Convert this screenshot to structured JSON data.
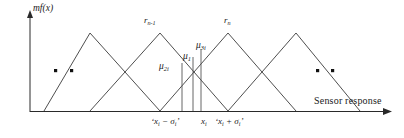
{
  "figure": {
    "axes": {
      "y_label": "mf(x)",
      "x_label": "Sensor response"
    },
    "fuzzy_sets": [
      {
        "name": "r-n-minus-1",
        "label_main": "r",
        "label_sub": "n-1"
      },
      {
        "name": "r-n",
        "label_main": "r",
        "label_sub": "n"
      }
    ],
    "membership_values": [
      {
        "name": "mu-2i",
        "label_main": "μ",
        "label_sub": "2i"
      },
      {
        "name": "mu-1i",
        "label_main": "μ",
        "label_sub": "1"
      },
      {
        "name": "mu-3i",
        "label_main": "μ",
        "label_sub": "3i"
      }
    ],
    "tick_labels": [
      {
        "name": "x-minus-sigma",
        "text": "‘x",
        "sub1": "i",
        "op": " − σ",
        "sub2": "i",
        "tail": "’"
      },
      {
        "name": "x-center",
        "text": "x",
        "sub1": "i",
        "op": "",
        "sub2": "",
        "tail": ""
      },
      {
        "name": "x-plus-sigma",
        "text": "‘x",
        "sub1": "i",
        "op": " + σ",
        "sub2": "i",
        "tail": "’"
      }
    ],
    "ellipsis": {
      "left_dots": 2,
      "right_dots": 2
    },
    "colors": {
      "stroke": "#2a2a2a",
      "background": "#ffffff",
      "text": "#1a1a1a"
    },
    "chart_geometry": {
      "type": "line",
      "description": "Overlapping triangular fuzzy membership functions with three vertical lines marking x_i - sigma_i, x_i and x_i + sigma_i",
      "baseline_y": 111,
      "peak_y": 33,
      "triangles": [
        {
          "left": 44,
          "apex": 90,
          "right": 160
        },
        {
          "left": 90,
          "apex": 160,
          "right": 228
        },
        {
          "left": 160,
          "apex": 228,
          "right": 296
        },
        {
          "left": 228,
          "apex": 296,
          "right": 360
        }
      ],
      "vertical_lines": [
        182,
        193,
        201
      ]
    }
  }
}
